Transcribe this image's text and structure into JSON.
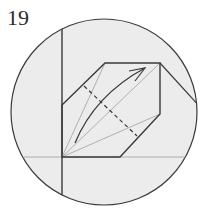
{
  "diagram": {
    "step_number": "19",
    "colors": {
      "background": "#ffffff",
      "circle_fill": "#ececec",
      "line": "#3a3a3a",
      "thin_line": "#a0a0a0"
    },
    "elements": [
      "circle-view",
      "hexagon-flap",
      "dashed-fold-line",
      "curved-fold-arrow",
      "vertical-edge",
      "horizontal-crease",
      "diagonal-edge"
    ]
  }
}
